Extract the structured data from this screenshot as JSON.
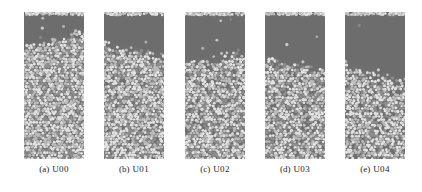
{
  "figure": {
    "name": "granular-column-snapshots",
    "background_color": "#ffffff",
    "panel_count": 5
  },
  "style": {
    "bed_background": "#6f6f6f",
    "dilute_background": "#6b6b6b",
    "particle_light": "#e2e2e2",
    "particle_mid": "#bdbdbd",
    "particle_dark": "#8f8f8f",
    "caption_color": "#1d1d1d"
  },
  "panels": [
    {
      "tag": "(a)",
      "name": "U00",
      "caption": "(a) U00",
      "left": 24,
      "interface_level": 0.18,
      "interface_tilt": -0.06,
      "packing_density": 1.0,
      "seed": 11
    },
    {
      "tag": "(b)",
      "name": "U01",
      "caption": "(b) U01",
      "left": 104,
      "interface_level": 0.25,
      "interface_tilt": 0.05,
      "packing_density": 0.97,
      "seed": 23
    },
    {
      "tag": "(c)",
      "name": "U02",
      "caption": "(c) U02",
      "left": 185,
      "interface_level": 0.31,
      "interface_tilt": -0.03,
      "packing_density": 0.94,
      "seed": 37
    },
    {
      "tag": "(d)",
      "name": "U03",
      "caption": "(d) U03",
      "left": 265,
      "interface_level": 0.35,
      "interface_tilt": 0.04,
      "packing_density": 0.92,
      "seed": 53
    },
    {
      "tag": "(e)",
      "name": "U04",
      "caption": "(e) U04",
      "left": 345,
      "interface_level": 0.41,
      "interface_tilt": 0.07,
      "packing_density": 0.9,
      "seed": 71
    }
  ]
}
